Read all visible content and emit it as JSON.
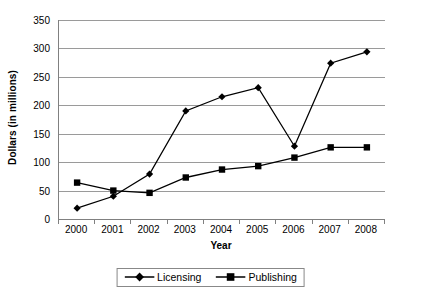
{
  "chart_data": {
    "type": "line",
    "title": "",
    "xlabel": "Year",
    "ylabel": "Dollars (in millions)",
    "categories": [
      "2000",
      "2001",
      "2002",
      "2003",
      "2004",
      "2005",
      "2006",
      "2007",
      "2008"
    ],
    "x": [
      2000,
      2001,
      2002,
      2003,
      2004,
      2005,
      2006,
      2007,
      2008
    ],
    "series": [
      {
        "name": "Licensing",
        "marker": "diamond",
        "color": "#000000",
        "values": [
          19,
          40,
          79,
          190,
          215,
          231,
          128,
          274,
          294
        ]
      },
      {
        "name": "Publishing",
        "marker": "square",
        "color": "#000000",
        "values": [
          64,
          50,
          46,
          73,
          87,
          93,
          108,
          126,
          126
        ]
      }
    ],
    "ylim": [
      0,
      350
    ],
    "ytick_values": [
      0,
      50,
      100,
      150,
      200,
      250,
      300,
      350
    ],
    "ytick_labels": [
      "0",
      "50",
      "100",
      "150",
      "200",
      "250",
      "300",
      "350"
    ],
    "grid": true,
    "grid_axis": "y",
    "legend_position": "bottom",
    "legend_entries": [
      "Licensing",
      "Publishing"
    ],
    "gridline_color": "#9a9a9a",
    "axis_color": "#808080",
    "background_color": "#ffffff"
  }
}
